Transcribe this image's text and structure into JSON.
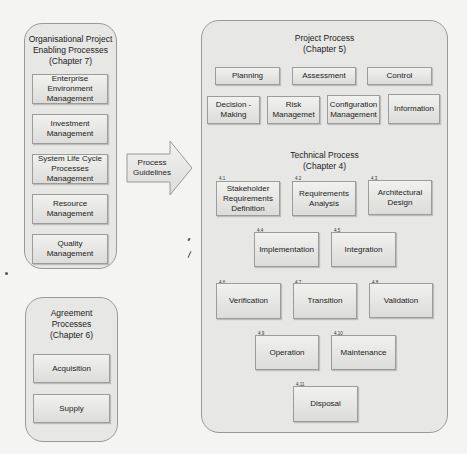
{
  "organisational": {
    "title_line1": "Organisational Project",
    "title_line2": "Enabling Processes",
    "title_line3": "(Chapter 7)",
    "items": [
      {
        "label": "Enterprise Environment Management"
      },
      {
        "label": "Investment Management"
      },
      {
        "label": "System Life Cycle Processes Management"
      },
      {
        "label": "Resource Management"
      },
      {
        "label": "Quality Management"
      }
    ]
  },
  "agreement": {
    "title_line1": "Agreement",
    "title_line2": "Processes",
    "title_line3": "(Chapter 6)",
    "items": [
      {
        "label": "Acquisition"
      },
      {
        "label": "Supply"
      }
    ]
  },
  "arrow": {
    "label": "Process Guidelines"
  },
  "project": {
    "title_line1": "Project Process",
    "title_line2": "(Chapter 5)",
    "items": [
      {
        "label": "Planning"
      },
      {
        "label": "Assessment"
      },
      {
        "label": "Control"
      },
      {
        "label": "Decision - Making"
      },
      {
        "label": "Risk Managemet"
      },
      {
        "label": "Configuration Management"
      },
      {
        "label": "Information"
      }
    ]
  },
  "technical": {
    "title_line1": "Technical Process",
    "title_line2": "(Chapter 4)",
    "items": [
      {
        "num": "4.1",
        "label": "Stakeholder Requirements Definition"
      },
      {
        "num": "4.2",
        "label": "Requirements Analysis"
      },
      {
        "num": "4.3",
        "label": "Architectural Design"
      },
      {
        "num": "4.4",
        "label": "Implementation"
      },
      {
        "num": "4.5",
        "label": "Integration"
      },
      {
        "num": "4.6",
        "label": "Verification"
      },
      {
        "num": "4.7",
        "label": "Transition"
      },
      {
        "num": "4.8",
        "label": "Validation"
      },
      {
        "num": "4.9",
        "label": "Operation"
      },
      {
        "num": "4.10",
        "label": "Maintenance"
      },
      {
        "num": "4.11",
        "label": "Disposal"
      }
    ]
  }
}
